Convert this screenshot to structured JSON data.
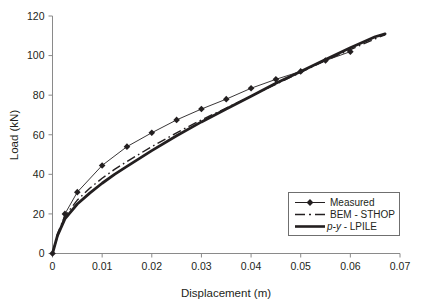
{
  "chart_data": {
    "type": "line",
    "title": "",
    "xlabel": "Displacement (m)",
    "ylabel": "Load (kN)",
    "xlim": [
      0,
      0.07
    ],
    "ylim": [
      0,
      120
    ],
    "xticks": [
      "0",
      "0.01",
      "0.02",
      "0.03",
      "0.04",
      "0.05",
      "0.06",
      "0.07"
    ],
    "xtick_values": [
      0,
      0.01,
      0.02,
      0.03,
      0.04,
      0.05,
      0.06,
      0.07
    ],
    "yticks": [
      "0",
      "20",
      "40",
      "60",
      "80",
      "100",
      "120"
    ],
    "ytick_values": [
      0,
      20,
      40,
      60,
      80,
      100,
      120
    ],
    "grid": false,
    "legend_position": "lower-right",
    "series": [
      {
        "name": "Measured",
        "style": "thin-line-with-diamond-markers",
        "color": "#231f20",
        "x": [
          0,
          0.0025,
          0.005,
          0.01,
          0.015,
          0.02,
          0.025,
          0.03,
          0.035,
          0.04,
          0.045,
          0.05,
          0.055,
          0.06
        ],
        "y": [
          0,
          20,
          31,
          44.5,
          54,
          61,
          67.5,
          73,
          78,
          83.5,
          88,
          92,
          97.5,
          102
        ]
      },
      {
        "name": "BEM - STHOP",
        "style": "dash-dot-line",
        "color": "#231f20",
        "x": [
          0,
          0.001,
          0.0025,
          0.005,
          0.0075,
          0.01,
          0.0125,
          0.015,
          0.02,
          0.025,
          0.03,
          0.035,
          0.04,
          0.045,
          0.05,
          0.055,
          0.06,
          0.065,
          0.067
        ],
        "y": [
          0,
          10,
          19,
          27,
          33,
          38,
          42.5,
          46.5,
          54,
          61,
          67.5,
          73.5,
          79.5,
          85.5,
          91.5,
          97.5,
          103,
          108.5,
          110.5
        ]
      },
      {
        "name": "p-y - LPILE",
        "style": "thick-solid-line",
        "color": "#231f20",
        "x": [
          0,
          0.001,
          0.0025,
          0.005,
          0.0075,
          0.01,
          0.0125,
          0.015,
          0.02,
          0.025,
          0.03,
          0.035,
          0.04,
          0.045,
          0.05,
          0.055,
          0.06,
          0.065,
          0.067
        ],
        "y": [
          0,
          9,
          17.5,
          25,
          30.5,
          35.5,
          40,
          44,
          52,
          59.5,
          66.5,
          73,
          79.5,
          86,
          92,
          98,
          104,
          109.5,
          111
        ]
      }
    ]
  },
  "legend": {
    "items": [
      {
        "label": "Measured",
        "key": "measured"
      },
      {
        "label": "BEM - STHOP",
        "key": "bem-sthop"
      },
      {
        "label": "p-y",
        "label_suffix": " - LPILE",
        "key": "py-lpile"
      }
    ]
  },
  "axes": {
    "x_title": "Displacement (m)",
    "y_title": "Load (kN)"
  }
}
